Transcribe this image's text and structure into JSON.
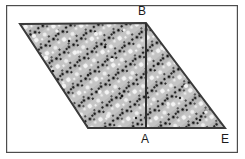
{
  "figure": {
    "kind": "geometry-diagram",
    "canvas": {
      "width": 245,
      "height": 159,
      "background": "#ffffff"
    },
    "frame": {
      "name": "image-border",
      "x": 6,
      "y": 5,
      "width": 232,
      "height": 148,
      "stroke": "#4d4d4d",
      "stroke_width": 1.2,
      "fill": "none"
    },
    "colors": {
      "fill": "#b5b5b5",
      "fill_light": "#c9c9c9",
      "outline": "#3a3a3a",
      "speck_dark": "#1c1c1c",
      "speck_light": "#f2f2f2",
      "label": "#1a1a1a",
      "frame": "#4d4d4d"
    },
    "shape": {
      "name": "parallelogram-ABE",
      "points": "20,24 146,23 225,128 88,128",
      "outline_width": 2.0
    },
    "divider": {
      "name": "segment-AB",
      "x1": 146,
      "y1": 23,
      "x2": 146,
      "y2": 128,
      "stroke_width": 2.0
    },
    "labels": [
      {
        "id": "B",
        "text": "B",
        "x": 138,
        "y": 5
      },
      {
        "id": "A",
        "text": "A",
        "x": 141,
        "y": 133
      },
      {
        "id": "E",
        "text": "E",
        "x": 221,
        "y": 133
      }
    ],
    "texture": {
      "style": "granite-speckle",
      "row_angle_deg": 37,
      "dot_radius_dark": 1.4,
      "blob_radius_light": 2.2
    }
  }
}
